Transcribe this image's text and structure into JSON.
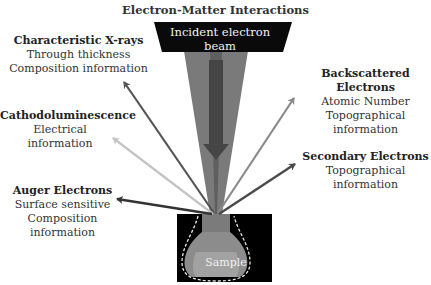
{
  "title": "Electron-Matter Interactions",
  "beam": {
    "label": "Incident electron beam"
  },
  "sample": {
    "label": "Sample"
  },
  "signals": [
    {
      "name": "Characteristic X-rays",
      "lines": [
        "Through thickness",
        "Composition information"
      ],
      "color": "#555555",
      "side": "left"
    },
    {
      "name": "Cathodoluminescence",
      "lines": [
        "Electrical information"
      ],
      "color": "#c4c4c4",
      "side": "left"
    },
    {
      "name": "Auger Electrons",
      "lines": [
        "Surface sensitive",
        "Composition information"
      ],
      "color": "#333333",
      "side": "left"
    },
    {
      "name": "Backscattered Electrons",
      "lines": [
        "Atomic Number",
        "Topographical information"
      ],
      "color": "#8a8a8a",
      "side": "right"
    },
    {
      "name": "Secondary Electrons",
      "lines": [
        "Topographical information"
      ],
      "color": "#4a4a4a",
      "side": "right"
    }
  ],
  "colors": {
    "beam_box": "#0a0a0a",
    "cone": "#7a7a7a",
    "cone_core": "#5a5a5a",
    "beam_arrow": "#444444",
    "sample_bg": "#000000",
    "sample_top": "#7b7b7b",
    "sample_mid": "#8c8c8c",
    "sample_bottom": "#a0a0a0"
  }
}
